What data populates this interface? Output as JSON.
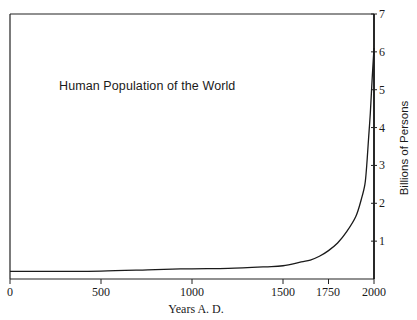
{
  "chart_data": {
    "type": "line",
    "title": "Human Population of the World",
    "xlabel": "Years A. D.",
    "ylabel": "Billions of Persons",
    "x_ticks": [
      0,
      500,
      1000,
      1500,
      1750,
      2000
    ],
    "x_tick_labels": [
      "0",
      "500",
      "1000",
      "1500",
      "1750",
      "2000"
    ],
    "y_ticks": [
      1,
      2,
      3,
      4,
      5,
      6,
      7
    ],
    "y_tick_labels": [
      "1",
      "2",
      "3",
      "4",
      "5",
      "6",
      "7"
    ],
    "xlim": [
      0,
      2000
    ],
    "ylim": [
      0,
      7
    ],
    "grid": false,
    "y_axis_position": "right",
    "series": [
      {
        "name": "World population",
        "x": [
          0,
          200,
          500,
          800,
          1000,
          1200,
          1400,
          1500,
          1600,
          1650,
          1700,
          1750,
          1800,
          1850,
          1900,
          1930,
          1950,
          1960,
          1970,
          1980,
          1990,
          2000
        ],
        "values": [
          0.2,
          0.2,
          0.21,
          0.25,
          0.27,
          0.28,
          0.32,
          0.35,
          0.45,
          0.5,
          0.6,
          0.75,
          0.95,
          1.25,
          1.65,
          2.1,
          2.5,
          3.0,
          3.7,
          4.4,
          5.3,
          6.1
        ]
      }
    ]
  }
}
